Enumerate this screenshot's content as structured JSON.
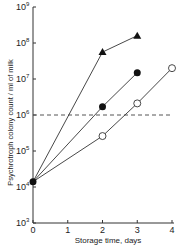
{
  "chart_data": {
    "type": "line",
    "title": "",
    "xlabel": "Storage time, days",
    "ylabel": "Psychrotroph colony count / ml of milk",
    "xlim": [
      0,
      4
    ],
    "ylim": [
      1000,
      1000000000
    ],
    "yscale": "log",
    "x_ticks": [
      "0",
      "1",
      "2",
      "3",
      "4"
    ],
    "y_ticks": [
      "10^3",
      "10^4",
      "10^5",
      "10^6",
      "10^7",
      "10^8",
      "10^9"
    ],
    "grid": false,
    "legend": "none",
    "reference_line": {
      "y": 1000000,
      "style": "dashed"
    },
    "series": [
      {
        "name": "filled triangles",
        "marker": "filled-triangle",
        "x": [
          0,
          2,
          3
        ],
        "y": [
          14000,
          56000000,
          160000000
        ]
      },
      {
        "name": "filled circles",
        "marker": "filled-circle",
        "x": [
          0,
          2,
          3
        ],
        "y": [
          14000,
          1700000,
          15000000
        ]
      },
      {
        "name": "open circles",
        "marker": "open-circle",
        "x": [
          0,
          2,
          3,
          4
        ],
        "y": [
          14000,
          260000,
          2100000,
          20000000
        ]
      }
    ]
  },
  "axes": {
    "xlabel": "Storage time, days",
    "ylabel": "Psychrotroph colony count / ml of milk",
    "xticks": [
      "0",
      "1",
      "2",
      "3",
      "4"
    ],
    "yticks": [
      "3",
      "4",
      "5",
      "6",
      "7",
      "8",
      "9"
    ],
    "ybase": "10"
  }
}
